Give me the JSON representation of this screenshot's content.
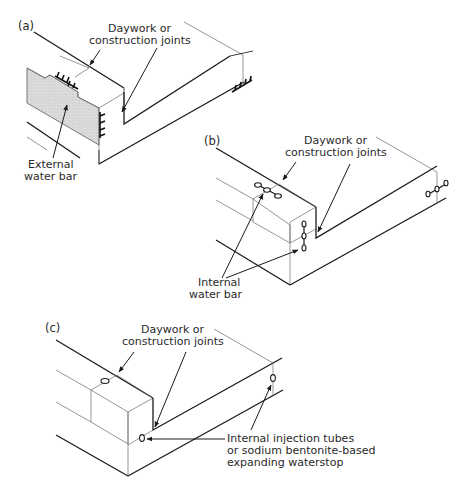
{
  "figure": {
    "colors": {
      "line": "#1a1a1a",
      "thin_line": "#6a6a6a",
      "hatch_fill": "#d9d9d9",
      "text": "#2a2a2a",
      "background": "#ffffff"
    }
  },
  "panels": [
    {
      "id": "a",
      "label": "(a)",
      "labels": {
        "joint_line1": "Daywork or",
        "joint_line2": "construction joints",
        "waterbar_line1": "External",
        "waterbar_line2": "water bar"
      },
      "seal_type": "external water bar (ribbed, on external face)"
    },
    {
      "id": "b",
      "label": "(b)",
      "labels": {
        "joint_line1": "Daywork or",
        "joint_line2": "construction joints",
        "waterbar_line1": "Internal",
        "waterbar_line2": "water bar"
      },
      "seal_type": "internal water bar (dumbbell, cast mid-section)"
    },
    {
      "id": "c",
      "label": "(c)",
      "labels": {
        "joint_line1": "Daywork or",
        "joint_line2": "construction joints",
        "stop_line1": "Internal injection tubes",
        "stop_line2": "or sodium bentonite-based",
        "stop_line3": "expanding waterstop"
      },
      "seal_type": "injection tube / hydrophilic waterstop"
    }
  ]
}
